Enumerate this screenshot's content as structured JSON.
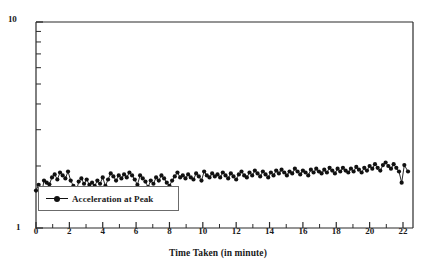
{
  "chart_data": {
    "type": "line",
    "title": "",
    "subtitle": "",
    "xlabel": "Time Taken (in minute)",
    "ylabel": "",
    "xlim": [
      0,
      22.6
    ],
    "ylim": [
      1,
      10
    ],
    "yscale": "log",
    "xscale": "linear",
    "grid": false,
    "legend_position": "lower-left",
    "x_tick_labels": [
      "0",
      "2",
      "4",
      "6",
      "8",
      "10",
      "12",
      "14",
      "16",
      "18",
      "20",
      "22"
    ],
    "x_tick_values": [
      0,
      2,
      4,
      6,
      8,
      10,
      12,
      14,
      16,
      18,
      20,
      22
    ],
    "x_minor_tick_values": [
      1,
      3,
      5,
      7,
      9,
      11,
      13,
      15,
      17,
      19,
      21
    ],
    "y_tick_labels": [
      "1",
      "10"
    ],
    "y_tick_values": [
      1,
      10
    ],
    "y_minor_tick_values": [
      2,
      3,
      4,
      5,
      6,
      7,
      8,
      9
    ],
    "marker": "filled-circle",
    "marker_color": "#111111",
    "line_color": "#111111",
    "series": [
      {
        "name": "Acceleration at Peak",
        "x": [
          0.0,
          0.16,
          0.32,
          0.48,
          0.64,
          0.8,
          0.96,
          1.12,
          1.28,
          1.44,
          1.6,
          1.76,
          1.92,
          2.08,
          2.24,
          2.4,
          2.56,
          2.72,
          2.88,
          3.04,
          3.2,
          3.36,
          3.52,
          3.68,
          3.84,
          4.0,
          4.16,
          4.32,
          4.48,
          4.64,
          4.8,
          4.96,
          5.12,
          5.28,
          5.44,
          5.6,
          5.76,
          5.92,
          6.08,
          6.24,
          6.4,
          6.56,
          6.72,
          6.88,
          7.04,
          7.2,
          7.36,
          7.52,
          7.68,
          7.84,
          8.0,
          8.16,
          8.32,
          8.48,
          8.64,
          8.8,
          8.96,
          9.12,
          9.28,
          9.44,
          9.6,
          9.76,
          9.92,
          10.08,
          10.24,
          10.4,
          10.56,
          10.72,
          10.88,
          11.04,
          11.2,
          11.36,
          11.52,
          11.68,
          11.84,
          12.0,
          12.16,
          12.32,
          12.48,
          12.64,
          12.8,
          12.96,
          13.12,
          13.28,
          13.44,
          13.6,
          13.76,
          13.92,
          14.08,
          14.24,
          14.4,
          14.56,
          14.72,
          14.88,
          15.04,
          15.2,
          15.36,
          15.52,
          15.68,
          15.84,
          16.0,
          16.16,
          16.32,
          16.48,
          16.64,
          16.8,
          16.96,
          17.12,
          17.28,
          17.44,
          17.6,
          17.76,
          17.92,
          18.08,
          18.24,
          18.4,
          18.56,
          18.72,
          18.88,
          19.04,
          19.2,
          19.36,
          19.52,
          19.68,
          19.84,
          20.0,
          20.16,
          20.32,
          20.48,
          20.64,
          20.8,
          20.96,
          21.12,
          21.28,
          21.44,
          21.6,
          21.76,
          21.92,
          22.08,
          22.3
        ],
        "y": [
          1.52,
          1.62,
          1.44,
          1.7,
          1.66,
          1.63,
          1.76,
          1.82,
          1.72,
          1.86,
          1.8,
          1.74,
          1.88,
          1.7,
          1.6,
          1.48,
          1.68,
          1.74,
          1.64,
          1.72,
          1.62,
          1.66,
          1.6,
          1.7,
          1.64,
          1.76,
          1.6,
          1.72,
          1.84,
          1.78,
          1.7,
          1.8,
          1.74,
          1.82,
          1.76,
          1.86,
          1.8,
          1.72,
          1.62,
          1.8,
          1.74,
          1.68,
          1.58,
          1.7,
          1.64,
          1.76,
          1.7,
          1.8,
          1.74,
          1.66,
          1.6,
          1.7,
          1.78,
          1.86,
          1.76,
          1.8,
          1.74,
          1.82,
          1.76,
          1.72,
          1.84,
          1.78,
          1.7,
          1.88,
          1.8,
          1.76,
          1.84,
          1.78,
          1.82,
          1.76,
          1.86,
          1.8,
          1.74,
          1.84,
          1.78,
          1.72,
          1.82,
          1.88,
          1.8,
          1.76,
          1.86,
          1.8,
          1.9,
          1.84,
          1.78,
          1.88,
          1.82,
          1.76,
          1.86,
          1.8,
          1.9,
          1.84,
          1.92,
          1.86,
          1.8,
          1.88,
          1.84,
          1.94,
          1.88,
          1.82,
          1.9,
          1.86,
          1.8,
          1.92,
          1.86,
          1.94,
          1.88,
          1.84,
          1.92,
          1.86,
          1.96,
          1.9,
          1.84,
          1.94,
          1.88,
          1.96,
          1.9,
          1.86,
          1.94,
          1.88,
          1.98,
          1.92,
          1.86,
          1.96,
          1.9,
          2.0,
          1.94,
          2.04,
          1.96,
          1.9,
          2.02,
          2.08,
          2.0,
          1.94,
          2.04,
          1.96,
          1.88,
          1.66,
          2.02,
          1.88
        ]
      }
    ]
  },
  "legend": {
    "entries": [
      {
        "label": "Acceleration at Peak",
        "marker": "filled-circle"
      }
    ]
  }
}
